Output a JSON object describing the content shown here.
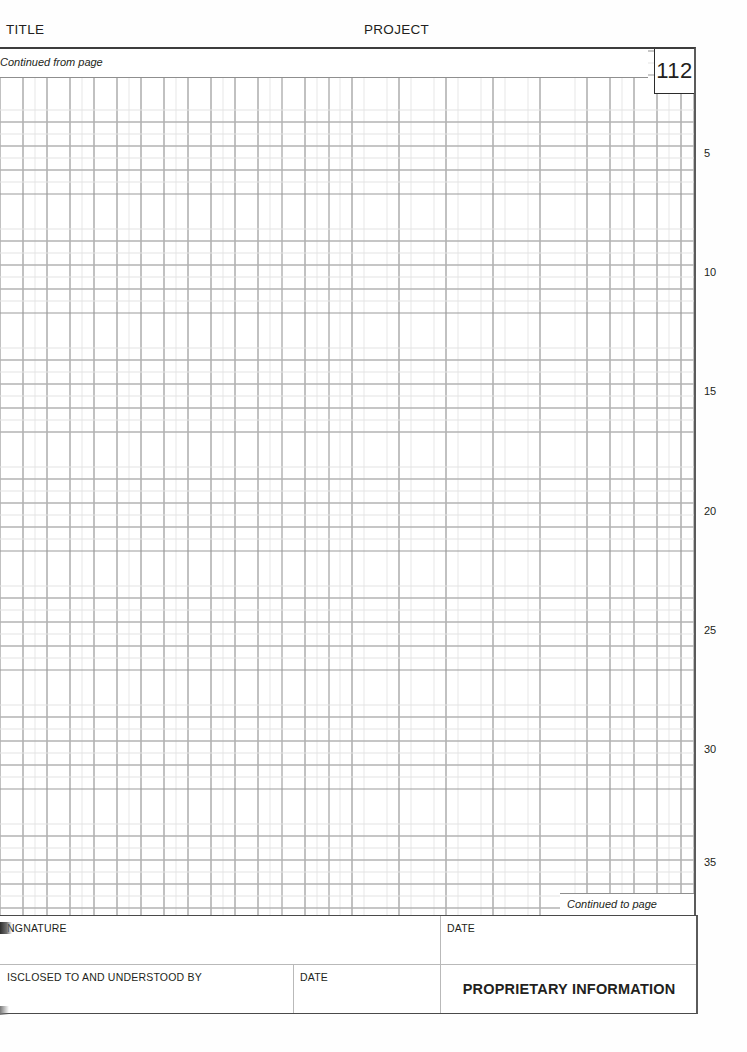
{
  "document": {
    "page_number": "112",
    "header": {
      "title_label": "TITLE",
      "project_label": "PROJECT"
    },
    "continued_from": "Continued from page",
    "continued_to": "Continued to page",
    "row_numbers": [
      "5",
      "10",
      "15",
      "20",
      "25",
      "30",
      "35"
    ],
    "footer": {
      "signature_label": "NGNATURE",
      "signature_date_label": "DATE",
      "disclosed_label": "ISCLOSED TO AND UNDERSTOOD BY",
      "disclosed_date_label": "DATE",
      "proprietary_notice": "PROPRIETARY INFORMATION"
    },
    "colors": {
      "ink": "#231f20",
      "grid_major": "#8f8f8f",
      "grid_minor": "#e4e4e4",
      "border": "#4a4a4a"
    }
  }
}
